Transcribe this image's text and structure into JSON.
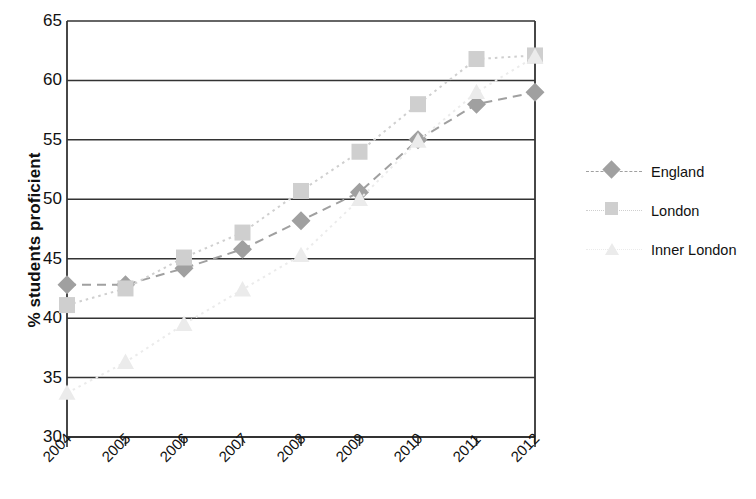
{
  "chart_data": {
    "type": "line",
    "title": "",
    "xlabel": "",
    "ylabel": "% students proficient",
    "categories": [
      "2004",
      "2005",
      "2006",
      "2007",
      "2008",
      "2009",
      "2010",
      "2011",
      "2012"
    ],
    "ylim": [
      30,
      65
    ],
    "y_ticks": [
      "30",
      "35",
      "40",
      "45",
      "50",
      "55",
      "60",
      "65"
    ],
    "grid": "horizontal",
    "legend_position": "right",
    "series": [
      {
        "name": "England",
        "marker": "diamond",
        "color": "#a0a0a0",
        "line_style": "dashed",
        "values": [
          42.8,
          42.8,
          44.2,
          45.8,
          48.2,
          50.6,
          55.0,
          58.0,
          59.0
        ]
      },
      {
        "name": "London",
        "marker": "square",
        "color": "#cfcfcf",
        "line_style": "dotted",
        "values": [
          41.1,
          42.5,
          45.1,
          47.2,
          50.7,
          54.0,
          58.0,
          61.8,
          62.1
        ]
      },
      {
        "name": "Inner London",
        "marker": "triangle",
        "color": "#ebebeb",
        "line_style": "dotted",
        "values": [
          33.7,
          36.3,
          39.5,
          42.4,
          45.3,
          50.0,
          54.9,
          59.0,
          62.0
        ]
      }
    ]
  },
  "axis": {
    "y_title": "% students proficient"
  },
  "legend": {
    "items": [
      {
        "label": "England"
      },
      {
        "label": "London"
      },
      {
        "label": "Inner London"
      }
    ]
  }
}
